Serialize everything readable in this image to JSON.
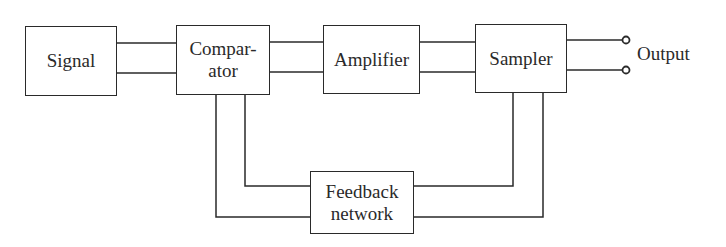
{
  "diagram": {
    "type": "block-diagram",
    "blocks": [
      {
        "id": "signal",
        "label_lines": [
          "Signal"
        ]
      },
      {
        "id": "comparator",
        "label_lines": [
          "Compar-",
          "ator"
        ]
      },
      {
        "id": "amplifier",
        "label_lines": [
          "Amplifier"
        ]
      },
      {
        "id": "sampler",
        "label_lines": [
          "Sampler"
        ]
      },
      {
        "id": "feedback",
        "label_lines": [
          "Feedback",
          "network"
        ]
      }
    ],
    "output_label": "Output",
    "connections": [
      {
        "from": "signal",
        "to": "comparator",
        "wires": 2
      },
      {
        "from": "comparator",
        "to": "amplifier",
        "wires": 2
      },
      {
        "from": "amplifier",
        "to": "sampler",
        "wires": 2
      },
      {
        "from": "sampler",
        "to": "output-terminals",
        "wires": 2
      },
      {
        "from": "sampler",
        "to": "feedback",
        "wires": 2
      },
      {
        "from": "feedback",
        "to": "comparator",
        "wires": 2
      }
    ],
    "colors": {
      "stroke": "#2a2a2a",
      "background": "#ffffff"
    }
  }
}
